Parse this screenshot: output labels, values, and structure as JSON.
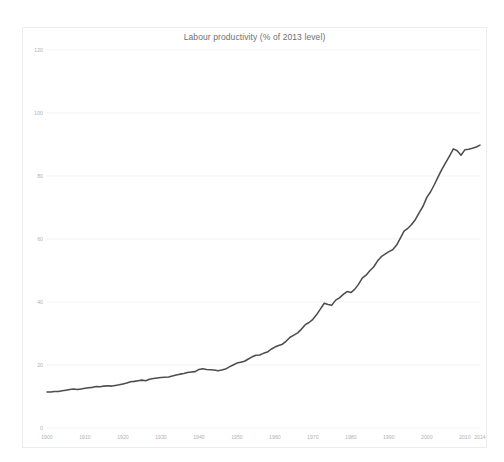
{
  "chart_data": {
    "type": "line",
    "title": "Labour productivity (% of 2013 level)",
    "xlabel": "",
    "ylabel": "",
    "xlim": [
      1900,
      2014
    ],
    "ylim": [
      0,
      120
    ],
    "grid": true,
    "legend": "none",
    "line_color": "#4d4d4d",
    "grid_color": "#ececec",
    "tick_color": "#b2b2b2",
    "yticks": [
      0,
      20,
      40,
      60,
      80,
      100,
      120
    ],
    "ytick_labels": [
      "0",
      "20",
      "40",
      "60",
      "80",
      "100",
      "120"
    ],
    "xticks": [
      1900,
      1910,
      1920,
      1930,
      1940,
      1950,
      1960,
      1970,
      1980,
      1990,
      2000,
      2010,
      2014
    ],
    "xtick_labels": [
      "1900",
      "1910",
      "1920",
      "1930",
      "1940",
      "1950",
      "1960",
      "1970",
      "1980",
      "1990",
      "2000",
      "2010",
      "2014"
    ],
    "series": [
      {
        "name": "Labour productivity",
        "x": [
          1900,
          1901,
          1902,
          1903,
          1904,
          1905,
          1906,
          1907,
          1908,
          1909,
          1910,
          1911,
          1912,
          1913,
          1914,
          1915,
          1916,
          1917,
          1918,
          1919,
          1920,
          1921,
          1922,
          1923,
          1924,
          1925,
          1926,
          1927,
          1928,
          1929,
          1930,
          1931,
          1932,
          1933,
          1934,
          1935,
          1936,
          1937,
          1938,
          1939,
          1940,
          1941,
          1942,
          1943,
          1944,
          1945,
          1946,
          1947,
          1948,
          1949,
          1950,
          1951,
          1952,
          1953,
          1954,
          1955,
          1956,
          1957,
          1958,
          1959,
          1960,
          1961,
          1962,
          1963,
          1964,
          1965,
          1966,
          1967,
          1968,
          1969,
          1970,
          1971,
          1972,
          1973,
          1974,
          1975,
          1976,
          1977,
          1978,
          1979,
          1980,
          1981,
          1982,
          1983,
          1984,
          1985,
          1986,
          1987,
          1988,
          1989,
          1990,
          1991,
          1992,
          1993,
          1994,
          1995,
          1996,
          1997,
          1998,
          1999,
          2000,
          2001,
          2002,
          2003,
          2004,
          2005,
          2006,
          2007,
          2008,
          2009,
          2010,
          2011,
          2012,
          2013,
          2014
        ],
        "values": [
          11.4,
          11.4,
          11.6,
          11.6,
          11.8,
          12.0,
          12.2,
          12.4,
          12.2,
          12.4,
          12.6,
          12.8,
          12.9,
          13.2,
          13.1,
          13.3,
          13.4,
          13.3,
          13.5,
          13.7,
          14.0,
          14.3,
          14.7,
          14.8,
          15.0,
          15.2,
          15.0,
          15.5,
          15.7,
          15.9,
          16.0,
          16.1,
          16.2,
          16.5,
          16.8,
          17.1,
          17.3,
          17.6,
          17.8,
          17.9,
          18.6,
          18.8,
          18.6,
          18.5,
          18.4,
          18.2,
          18.4,
          18.7,
          19.4,
          20.0,
          20.6,
          20.9,
          21.2,
          21.9,
          22.6,
          23.1,
          23.2,
          23.7,
          24.1,
          25.0,
          25.7,
          26.2,
          26.6,
          27.6,
          28.8,
          29.5,
          30.2,
          31.4,
          32.8,
          33.5,
          34.5,
          36.0,
          37.8,
          39.6,
          39.2,
          39.0,
          40.6,
          41.3,
          42.4,
          43.3,
          43.0,
          44.0,
          45.6,
          47.6,
          48.5,
          49.9,
          51.1,
          53.0,
          54.4,
          55.2,
          56.0,
          56.6,
          58.0,
          60.2,
          62.5,
          63.4,
          64.6,
          66.2,
          68.4,
          70.4,
          73.2,
          75.0,
          77.3,
          79.8,
          82.2,
          84.3,
          86.4,
          88.6,
          88.0,
          86.6,
          88.3,
          88.5,
          88.8,
          89.2,
          89.8
        ]
      }
    ]
  }
}
